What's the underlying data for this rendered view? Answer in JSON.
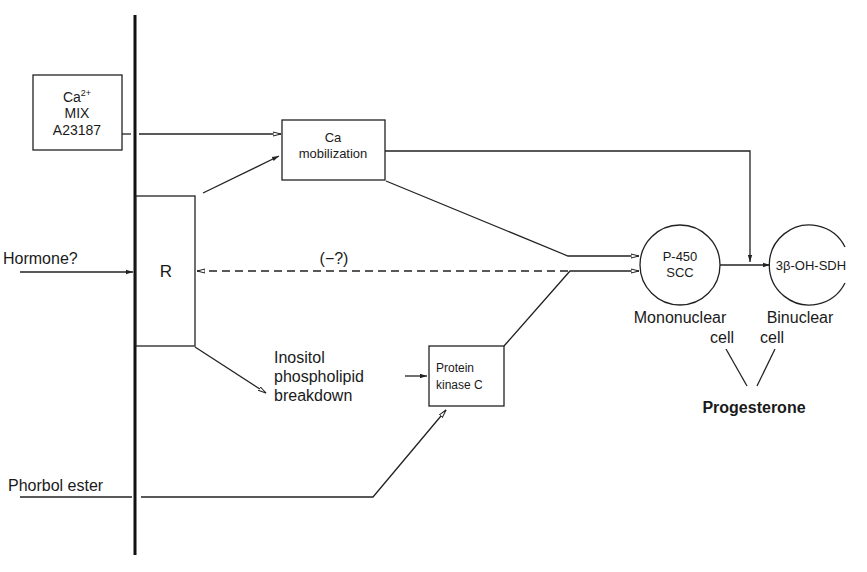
{
  "diagram": {
    "type": "signaling-pathway",
    "inputs": {
      "ca_box": {
        "line1": "Ca",
        "sup": "2+",
        "line2": "MIX",
        "line3": "A23187"
      },
      "hormone": "Hormone?",
      "phorbol": "Phorbol ester"
    },
    "receptor": {
      "label": "R"
    },
    "ca_mobilization": {
      "line1": "Ca",
      "line2": "mobilization"
    },
    "feedback_label": "(−?)",
    "inositol": {
      "line1": "Inositol",
      "line2": "phospholipid",
      "line3": "breakdown"
    },
    "pkc": {
      "line1": "Protein",
      "line2": "kinase C"
    },
    "p450": {
      "line1": "P-450",
      "line2": "SCC"
    },
    "hsd": {
      "label": "3β-OH-SDH"
    },
    "mononuclear": {
      "line1": "Mononuclear",
      "line2": "cell"
    },
    "binuclear": {
      "line1": "Binuclear",
      "line2": "cell"
    },
    "output": "Progesterone"
  }
}
